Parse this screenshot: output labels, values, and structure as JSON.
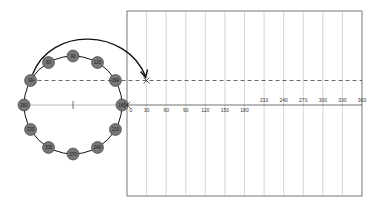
{
  "diagram": {
    "circle": {
      "node_labels": [
        "360",
        "30",
        "60",
        "90",
        "120",
        "150",
        "180",
        "210",
        "240",
        "270",
        "300",
        "330"
      ],
      "node_angles_deg": [
        0,
        30,
        60,
        90,
        120,
        150,
        180,
        210,
        240,
        270,
        300,
        330
      ],
      "highlighted_angle": 30
    },
    "graph": {
      "x_axis_origin_label": "0",
      "x_ticks_below": [
        "30",
        "60",
        "90",
        "120",
        "150",
        "180"
      ],
      "x_ticks_above": [
        "210",
        "240",
        "270",
        "300",
        "330",
        "360"
      ],
      "x_tick_values": [
        30,
        60,
        90,
        120,
        150,
        180,
        210,
        240,
        270,
        300,
        330,
        360
      ],
      "x_range": [
        0,
        360
      ],
      "plotted_point": {
        "x": 30,
        "y": 0.5,
        "marker": "x"
      },
      "dashed_projection_y": 0.5
    },
    "colors": {
      "node_fill": "#777777",
      "line": "#111111",
      "grid": "#bbbbbb",
      "dashed": "#444444"
    }
  }
}
